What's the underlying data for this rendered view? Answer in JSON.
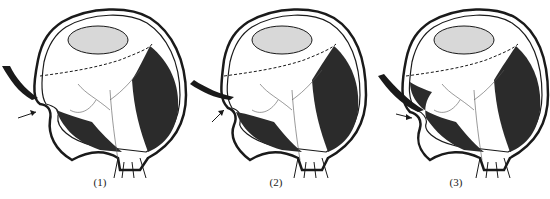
{
  "figure": {
    "panels": [
      {
        "id": 1,
        "label": "(1)",
        "buckle_depth": "shallow"
      },
      {
        "id": 2,
        "label": "(2)",
        "buckle_depth": "medium"
      },
      {
        "id": 3,
        "label": "(3)",
        "buckle_depth": "deep"
      }
    ],
    "colors": {
      "ink": "#1a1a1a",
      "shade": "#2b2b2b",
      "lens_fill": "#d8d8d8",
      "background": "#ffffff"
    }
  }
}
